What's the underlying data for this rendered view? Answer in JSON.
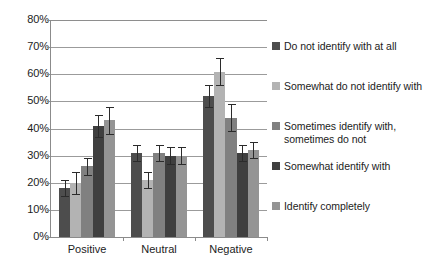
{
  "chart_data": {
    "type": "bar",
    "title": "",
    "xlabel": "",
    "ylabel": "",
    "ylim": [
      0,
      0.8
    ],
    "y_ticks": [
      "0%",
      "10%",
      "20%",
      "30%",
      "40%",
      "50%",
      "60%",
      "70%",
      "80%"
    ],
    "y_tick_values": [
      0,
      10,
      20,
      30,
      40,
      50,
      60,
      70,
      80
    ],
    "grid": true,
    "legend_position": "right",
    "categories": [
      "Positive",
      "Neutral",
      "Negative"
    ],
    "series": [
      {
        "name": "Do not identify with at all",
        "color": "#4d4d4d",
        "values": [
          18,
          31,
          52
        ],
        "errors": [
          3,
          3,
          4
        ]
      },
      {
        "name": "Somewhat do not identify with",
        "color": "#b3b3b3",
        "values": [
          20,
          21,
          61
        ],
        "errors": [
          4,
          3,
          5
        ]
      },
      {
        "name": "Sometimes identify with, sometimes do not",
        "color": "#808080",
        "values": [
          26,
          31,
          44
        ],
        "errors": [
          3,
          3,
          5
        ]
      },
      {
        "name": "Somewhat identify with",
        "color": "#3f3f3f",
        "values": [
          41,
          30,
          31
        ],
        "errors": [
          4,
          3,
          3
        ]
      },
      {
        "name": "Identify completely",
        "color": "#949494",
        "values": [
          43,
          30,
          32
        ],
        "errors": [
          5,
          3,
          3
        ]
      }
    ]
  },
  "legend": {
    "items": [
      {
        "label": "Do not identify with at all",
        "color": "#4d4d4d"
      },
      {
        "label": "Somewhat do not identify with",
        "color": "#b3b3b3"
      },
      {
        "label": "Sometimes identify with, sometimes do not",
        "color": "#808080"
      },
      {
        "label": "Somewhat identify with",
        "color": "#3f3f3f"
      },
      {
        "label": "Identify completely",
        "color": "#949494"
      }
    ]
  }
}
